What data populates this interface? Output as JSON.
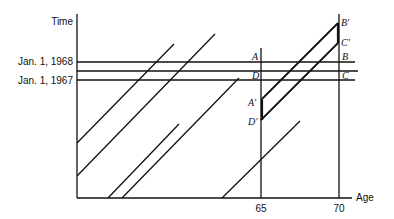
{
  "axes": {
    "y_label": "Time",
    "x_label": "Age",
    "y_ticks": [
      "Jan. 1, 1968",
      "Jan. 1, 1967"
    ],
    "x_ticks": [
      "65",
      "70"
    ]
  },
  "points": {
    "A": "A",
    "B": "B",
    "C": "C",
    "D": "D",
    "A_prime": "A′",
    "B_prime": "B′",
    "C_prime": "C′",
    "D_prime": "D′"
  },
  "colors": {
    "line": "#111111",
    "background": "#ffffff"
  }
}
